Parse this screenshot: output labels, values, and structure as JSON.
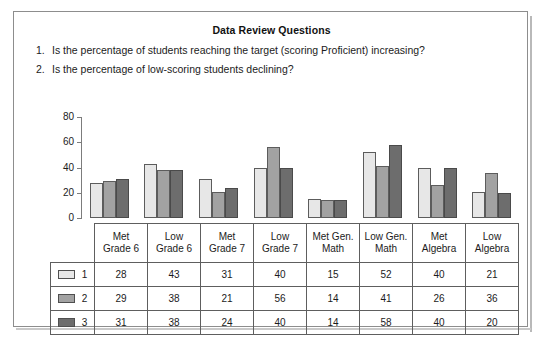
{
  "header": {
    "title": "Data Review Questions",
    "questions": [
      {
        "num": "1.",
        "text": "Is the percentage of students reaching the target (scoring Proficient) increasing?"
      },
      {
        "num": "2.",
        "text": "Is the percentage of low-scoring students declining?"
      }
    ]
  },
  "colors": {
    "series_1": "#e7e7e7",
    "series_2": "#a2a2a2",
    "series_3": "#6d6d6d",
    "bar_outline": "#5c5c5c",
    "frame": "#8d8d8d",
    "table_border": "#5e5e5e"
  },
  "chart_data": {
    "type": "bar",
    "title": "",
    "xlabel": "",
    "ylabel": "",
    "ylim": [
      0,
      80
    ],
    "yticks": [
      0,
      20,
      40,
      60,
      80
    ],
    "grid": false,
    "legend_position": "table-left-column",
    "categories": [
      "Met Grade 6",
      "Low Grade 6",
      "Met Grade 7",
      "Low Grade 7",
      "Met Gen. Math",
      "Low Gen. Math",
      "Met Algebra",
      "Low Algebra"
    ],
    "category_lines": [
      [
        "Met",
        "Grade 6"
      ],
      [
        "Low",
        "Grade 6"
      ],
      [
        "Met",
        "Grade 7"
      ],
      [
        "Low",
        "Grade 7"
      ],
      [
        "Met Gen.",
        "Math"
      ],
      [
        "Low Gen.",
        "Math"
      ],
      [
        "Met",
        "Algebra"
      ],
      [
        "Low",
        "Algebra"
      ]
    ],
    "series": [
      {
        "name": "1",
        "values": [
          28,
          43,
          31,
          40,
          15,
          52,
          40,
          21
        ]
      },
      {
        "name": "2",
        "values": [
          29,
          38,
          21,
          56,
          14,
          41,
          26,
          36
        ]
      },
      {
        "name": "3",
        "values": [
          31,
          38,
          24,
          40,
          14,
          58,
          40,
          20
        ]
      }
    ]
  },
  "table": {
    "legend_labels": [
      "1",
      "2",
      "3"
    ]
  }
}
